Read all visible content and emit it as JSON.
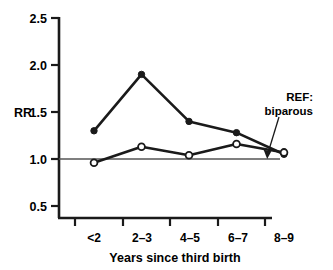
{
  "chart_data": {
    "type": "line",
    "title": "",
    "xlabel": "Years since third birth",
    "ylabel": "RR",
    "categories": [
      "<2",
      "2–3",
      "4–5",
      "6–7",
      "8–9"
    ],
    "ylim": [
      0.5,
      2.5
    ],
    "yticks": [
      0.5,
      1.0,
      1.5,
      2.0,
      2.5
    ],
    "ytick_labels": [
      "0.5",
      "1.0",
      "1.5",
      "2.0",
      "2.5"
    ],
    "grid": false,
    "legend": "none",
    "reference_line": {
      "value": 1.0,
      "label_line1": "REF:",
      "label_line2": "biparous"
    },
    "series": [
      {
        "name": "filled-series",
        "marker": "filled-circle",
        "values": [
          1.3,
          1.9,
          1.4,
          1.28,
          1.05
        ]
      },
      {
        "name": "open-series",
        "marker": "open-circle",
        "values": [
          0.96,
          1.13,
          1.04,
          1.16,
          1.07
        ]
      }
    ]
  },
  "axes": {
    "y_axis_label": "RR",
    "x_axis_title": "Years since third birth",
    "y_tick_labels": [
      "2.5",
      "2.0",
      "1.5",
      "1.0",
      "0.5"
    ],
    "x_tick_labels": [
      "<2",
      "2–3",
      "4–5",
      "6–7",
      "8–9"
    ]
  },
  "annotation": {
    "line1": "REF:",
    "line2": "biparous"
  },
  "colors": {
    "ink": "#1a1a1a",
    "background": "#ffffff",
    "reference_line": "#555555"
  }
}
